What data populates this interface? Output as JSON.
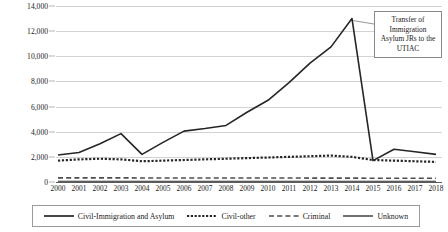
{
  "chart_data": {
    "type": "line",
    "title": "",
    "xlabel": "",
    "ylabel": "",
    "x": [
      2000,
      2001,
      2002,
      2003,
      2004,
      2005,
      2006,
      2007,
      2008,
      2009,
      2010,
      2011,
      2012,
      2013,
      2014,
      2015,
      2016,
      2017,
      2018
    ],
    "categories": [
      "2000",
      "2001",
      "2002",
      "2003",
      "2004",
      "2005",
      "2006",
      "2007",
      "2008",
      "2009",
      "2010",
      "2011",
      "2012",
      "2013",
      "2014",
      "2015",
      "2016",
      "2017",
      "2018"
    ],
    "ylim": [
      0,
      14000
    ],
    "yticks": [
      0,
      2000,
      4000,
      6000,
      8000,
      10000,
      12000,
      14000
    ],
    "ytick_labels": [
      "0",
      "2,000",
      "4,000",
      "6,000",
      "8,000",
      "10,000",
      "12,000",
      "14,000"
    ],
    "grid": true,
    "legend_position": "bottom",
    "series": [
      {
        "name": "Civil-Immigration and Asylum",
        "style": "solid",
        "color": "#262626",
        "values": [
          2150,
          2350,
          3050,
          3850,
          2200,
          3150,
          4050,
          4250,
          4500,
          5550,
          6500,
          7900,
          9450,
          10750,
          13000,
          1700,
          2600,
          2400,
          2200
        ]
      },
      {
        "name": "Civil-other",
        "style": "dotted",
        "color": "#262626",
        "values": [
          1700,
          1800,
          1850,
          1800,
          1650,
          1700,
          1750,
          1800,
          1850,
          1900,
          1950,
          2000,
          2050,
          2100,
          2000,
          1750,
          1700,
          1650,
          1600
        ]
      },
      {
        "name": "Criminal",
        "style": "dashed",
        "color": "#4d4d4d",
        "values": [
          330,
          330,
          330,
          330,
          320,
          320,
          320,
          320,
          320,
          320,
          320,
          320,
          310,
          310,
          310,
          300,
          300,
          300,
          300
        ]
      },
      {
        "name": "Unknown",
        "style": "solid-thin",
        "color": "#262626",
        "values": [
          60,
          60,
          60,
          60,
          60,
          60,
          60,
          60,
          60,
          60,
          60,
          60,
          60,
          60,
          60,
          60,
          60,
          60,
          60
        ]
      }
    ],
    "annotations": [
      {
        "text": "Transfer of Immigration Asylum JRs to the UTIAC",
        "lines": [
          "Transfer of",
          "Immigration",
          "Asylum JRs to the",
          "UTIAC"
        ],
        "points_to_year": 2014,
        "points_to_value": 13000
      }
    ]
  },
  "legend": {
    "items": [
      {
        "label": "Civil-Immigration and Asylum",
        "style": "solid"
      },
      {
        "label": "Civil-other",
        "style": "dotted"
      },
      {
        "label": "Criminal",
        "style": "dashed"
      },
      {
        "label": "Unknown",
        "style": "solid-thin"
      }
    ]
  }
}
